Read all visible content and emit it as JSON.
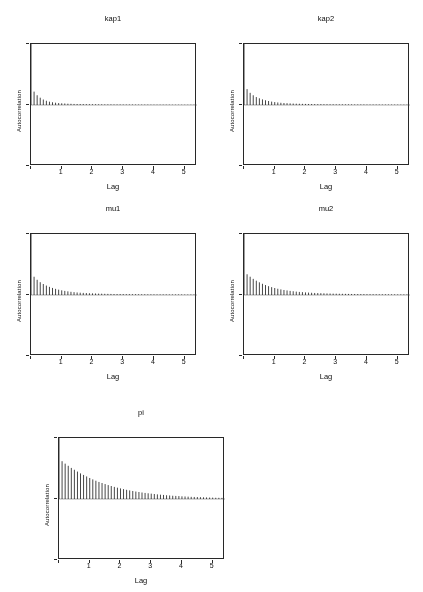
{
  "page": {
    "running_title": "ILERI ZAMAN",
    "background_color": "#ffffff",
    "ink_color": "#2b2b2b"
  },
  "axes": {
    "ylabel": "Autocorrelation",
    "xlabel": "Lag",
    "xticks": [
      "1",
      "2",
      "3",
      "4",
      "5"
    ],
    "xtick_values": [
      1,
      2,
      3,
      4,
      5
    ],
    "yticks": [
      "",
      "",
      ""
    ],
    "xlim": [
      0,
      5.4
    ],
    "ylim": [
      -1,
      1
    ]
  },
  "chart_data": [
    {
      "type": "bar",
      "title": "kap1",
      "xlabel": "Lag",
      "ylabel": "Autocorrelation",
      "xlim": [
        0,
        5.4
      ],
      "ylim": [
        -1,
        1
      ],
      "grid": false,
      "legend": "none",
      "panel": {
        "row": 1,
        "col": 1
      },
      "decay": 0.52,
      "lag_step": 0.1,
      "n_lags": 54,
      "x": [
        0,
        0.1,
        0.2,
        0.3,
        0.4,
        0.5,
        0.6,
        0.7,
        0.8,
        0.9,
        1.0,
        1.1,
        1.2,
        1.3,
        1.4,
        1.5,
        1.6,
        1.7,
        1.8,
        1.9,
        2.0,
        2.1,
        2.2,
        2.3,
        2.4,
        2.5,
        2.6,
        2.7,
        2.8,
        2.9,
        3.0,
        3.1,
        3.2,
        3.3,
        3.4,
        3.5,
        3.6,
        3.7,
        3.8,
        3.9,
        4.0,
        4.1,
        4.2,
        4.3,
        4.4,
        4.5,
        4.6,
        4.7,
        4.8,
        4.9,
        5.0,
        5.1,
        5.2,
        5.3
      ],
      "values": [
        1.0,
        0.22,
        0.16,
        0.12,
        0.09,
        0.07,
        0.055,
        0.045,
        0.038,
        0.032,
        0.028,
        0.025,
        0.022,
        0.02,
        0.018,
        0.017,
        0.016,
        0.015,
        0.014,
        0.013,
        0.012,
        0.012,
        0.011,
        0.011,
        0.01,
        0.01,
        0.01,
        0.009,
        0.009,
        0.009,
        0.008,
        0.008,
        0.008,
        0.008,
        0.007,
        0.007,
        0.007,
        0.007,
        0.007,
        0.006,
        0.006,
        0.006,
        0.006,
        0.006,
        0.006,
        0.006,
        0.005,
        0.005,
        0.005,
        0.005,
        0.005,
        0.005,
        0.005,
        0.005
      ]
    },
    {
      "type": "bar",
      "title": "kap2",
      "xlabel": "Lag",
      "ylabel": "Autocorrelation",
      "xlim": [
        0,
        5.4
      ],
      "ylim": [
        -1,
        1
      ],
      "grid": false,
      "legend": "none",
      "panel": {
        "row": 1,
        "col": 2
      },
      "decay": 0.62,
      "lag_step": 0.1,
      "n_lags": 54,
      "x": [
        0,
        0.1,
        0.2,
        0.3,
        0.4,
        0.5,
        0.6,
        0.7,
        0.8,
        0.9,
        1.0,
        1.1,
        1.2,
        1.3,
        1.4,
        1.5,
        1.6,
        1.7,
        1.8,
        1.9,
        2.0,
        2.1,
        2.2,
        2.3,
        2.4,
        2.5,
        2.6,
        2.7,
        2.8,
        2.9,
        3.0,
        3.1,
        3.2,
        3.3,
        3.4,
        3.5,
        3.6,
        3.7,
        3.8,
        3.9,
        4.0,
        4.1,
        4.2,
        4.3,
        4.4,
        4.5,
        4.6,
        4.7,
        4.8,
        4.9,
        5.0,
        5.1,
        5.2,
        5.3
      ],
      "values": [
        1.0,
        0.26,
        0.2,
        0.16,
        0.13,
        0.11,
        0.092,
        0.078,
        0.066,
        0.056,
        0.048,
        0.042,
        0.037,
        0.033,
        0.03,
        0.027,
        0.024,
        0.022,
        0.021,
        0.019,
        0.018,
        0.017,
        0.016,
        0.015,
        0.014,
        0.014,
        0.013,
        0.013,
        0.012,
        0.012,
        0.011,
        0.011,
        0.011,
        0.01,
        0.01,
        0.01,
        0.009,
        0.009,
        0.009,
        0.009,
        0.008,
        0.008,
        0.008,
        0.008,
        0.008,
        0.007,
        0.007,
        0.007,
        0.007,
        0.007,
        0.007,
        0.006,
        0.006,
        0.006
      ]
    },
    {
      "type": "bar",
      "title": "mu1",
      "xlabel": "Lag",
      "ylabel": "Autocorrelation",
      "xlim": [
        0,
        5.4
      ],
      "ylim": [
        -1,
        1
      ],
      "grid": false,
      "legend": "none",
      "panel": {
        "row": 2,
        "col": 1
      },
      "decay": 0.72,
      "lag_step": 0.1,
      "n_lags": 54,
      "x": [
        0,
        0.1,
        0.2,
        0.3,
        0.4,
        0.5,
        0.6,
        0.7,
        0.8,
        0.9,
        1.0,
        1.1,
        1.2,
        1.3,
        1.4,
        1.5,
        1.6,
        1.7,
        1.8,
        1.9,
        2.0,
        2.1,
        2.2,
        2.3,
        2.4,
        2.5,
        2.6,
        2.7,
        2.8,
        2.9,
        3.0,
        3.1,
        3.2,
        3.3,
        3.4,
        3.5,
        3.6,
        3.7,
        3.8,
        3.9,
        4.0,
        4.1,
        4.2,
        4.3,
        4.4,
        4.5,
        4.6,
        4.7,
        4.8,
        4.9,
        5.0,
        5.1,
        5.2,
        5.3
      ],
      "values": [
        1.0,
        0.3,
        0.25,
        0.21,
        0.18,
        0.155,
        0.134,
        0.116,
        0.101,
        0.088,
        0.077,
        0.068,
        0.06,
        0.053,
        0.047,
        0.042,
        0.038,
        0.035,
        0.032,
        0.029,
        0.027,
        0.025,
        0.023,
        0.022,
        0.02,
        0.019,
        0.018,
        0.017,
        0.016,
        0.016,
        0.015,
        0.014,
        0.014,
        0.013,
        0.013,
        0.012,
        0.012,
        0.012,
        0.011,
        0.011,
        0.011,
        0.01,
        0.01,
        0.01,
        0.01,
        0.009,
        0.009,
        0.009,
        0.009,
        0.009,
        0.008,
        0.008,
        0.008,
        0.008
      ]
    },
    {
      "type": "bar",
      "title": "mu2",
      "xlabel": "Lag",
      "ylabel": "Autocorrelation",
      "xlim": [
        0,
        5.4
      ],
      "ylim": [
        -1,
        1
      ],
      "grid": false,
      "legend": "none",
      "panel": {
        "row": 2,
        "col": 2
      },
      "decay": 0.8,
      "lag_step": 0.1,
      "n_lags": 54,
      "x": [
        0,
        0.1,
        0.2,
        0.3,
        0.4,
        0.5,
        0.6,
        0.7,
        0.8,
        0.9,
        1.0,
        1.1,
        1.2,
        1.3,
        1.4,
        1.5,
        1.6,
        1.7,
        1.8,
        1.9,
        2.0,
        2.1,
        2.2,
        2.3,
        2.4,
        2.5,
        2.6,
        2.7,
        2.8,
        2.9,
        3.0,
        3.1,
        3.2,
        3.3,
        3.4,
        3.5,
        3.6,
        3.7,
        3.8,
        3.9,
        4.0,
        4.1,
        4.2,
        4.3,
        4.4,
        4.5,
        4.6,
        4.7,
        4.8,
        4.9,
        5.0,
        5.1,
        5.2,
        5.3
      ],
      "values": [
        1.0,
        0.34,
        0.3,
        0.265,
        0.235,
        0.208,
        0.184,
        0.163,
        0.145,
        0.129,
        0.115,
        0.103,
        0.092,
        0.083,
        0.075,
        0.068,
        0.062,
        0.056,
        0.051,
        0.047,
        0.043,
        0.04,
        0.037,
        0.034,
        0.032,
        0.03,
        0.028,
        0.026,
        0.025,
        0.023,
        0.022,
        0.021,
        0.02,
        0.019,
        0.018,
        0.017,
        0.017,
        0.016,
        0.015,
        0.015,
        0.014,
        0.014,
        0.013,
        0.013,
        0.012,
        0.012,
        0.012,
        0.011,
        0.011,
        0.011,
        0.01,
        0.01,
        0.01,
        0.01
      ]
    },
    {
      "type": "bar",
      "title": "pi",
      "xlabel": "Lag",
      "ylabel": "Autocorrelation",
      "xlim": [
        0,
        5.4
      ],
      "ylim": [
        -1,
        1
      ],
      "grid": false,
      "legend": "none",
      "panel": {
        "row": 3,
        "col": 1
      },
      "decay": 0.93,
      "lag_step": 0.1,
      "n_lags": 54,
      "x": [
        0,
        0.1,
        0.2,
        0.3,
        0.4,
        0.5,
        0.6,
        0.7,
        0.8,
        0.9,
        1.0,
        1.1,
        1.2,
        1.3,
        1.4,
        1.5,
        1.6,
        1.7,
        1.8,
        1.9,
        2.0,
        2.1,
        2.2,
        2.3,
        2.4,
        2.5,
        2.6,
        2.7,
        2.8,
        2.9,
        3.0,
        3.1,
        3.2,
        3.3,
        3.4,
        3.5,
        3.6,
        3.7,
        3.8,
        3.9,
        4.0,
        4.1,
        4.2,
        4.3,
        4.4,
        4.5,
        4.6,
        4.7,
        4.8,
        4.9,
        5.0,
        5.1,
        5.2,
        5.3
      ],
      "values": [
        1.0,
        0.62,
        0.58,
        0.545,
        0.51,
        0.48,
        0.45,
        0.42,
        0.395,
        0.37,
        0.345,
        0.322,
        0.3,
        0.28,
        0.262,
        0.245,
        0.228,
        0.213,
        0.199,
        0.186,
        0.174,
        0.162,
        0.151,
        0.141,
        0.132,
        0.123,
        0.115,
        0.107,
        0.1,
        0.094,
        0.088,
        0.082,
        0.076,
        0.071,
        0.067,
        0.062,
        0.058,
        0.054,
        0.051,
        0.048,
        0.044,
        0.042,
        0.039,
        0.036,
        0.034,
        0.032,
        0.03,
        0.028,
        0.026,
        0.024,
        0.023,
        0.021,
        0.02,
        0.019
      ]
    }
  ]
}
